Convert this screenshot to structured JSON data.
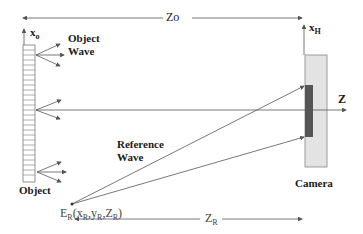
{
  "diagram": {
    "type": "off-axis digital holography setup",
    "labels": {
      "distance_top": "Zo",
      "object_axis": "x",
      "object_axis_sub": "o",
      "hologram_axis": "x",
      "hologram_axis_sub": "H",
      "optical_axis": "Z",
      "object_wave": "Object",
      "object_wave_2": "Wave",
      "reference_wave": "Reference",
      "reference_wave_2": "Wave",
      "object": "Object",
      "camera": "Camera",
      "ref_source_main": "E",
      "ref_source_sub": "R",
      "ref_source_open": "(x",
      "ref_source_xsub": "R",
      "ref_source_y": ",y",
      "ref_source_ysub": "R",
      "ref_source_z": ",Z",
      "ref_source_zsub": "R",
      "ref_source_close": ")",
      "distance_bottom": "Z",
      "distance_bottom_sub": "R"
    },
    "colors": {
      "line": "#555555",
      "camera_body": "#e3e3e3",
      "camera_sensor": "#555555",
      "object_fill": "#ffffff",
      "object_stripes": "#888888"
    }
  }
}
